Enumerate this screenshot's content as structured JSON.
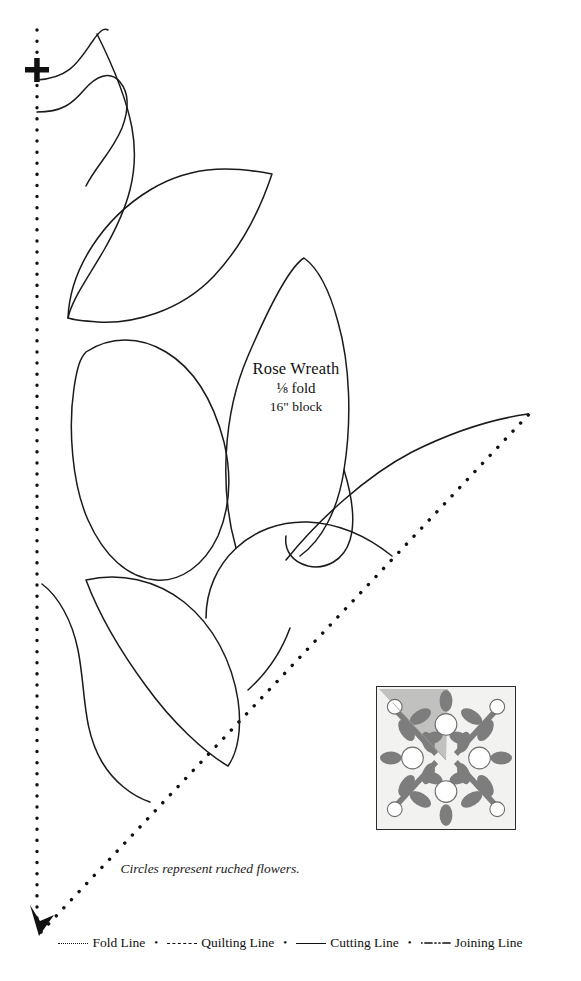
{
  "pattern": {
    "title": "Rose Wreath",
    "fold": "⅛ fold",
    "block_size": "16\" block",
    "caption": "Circles represent ruched flowers."
  },
  "legend": {
    "items": [
      {
        "style": "dotted",
        "label": "Fold Line"
      },
      {
        "style": "dashed",
        "label": "Quilting Line"
      },
      {
        "style": "solid",
        "label": "Cutting Line"
      },
      {
        "style": "dashdot",
        "label": "Joining Line"
      }
    ],
    "separator": "•"
  },
  "thumbnail": {
    "name": "rose-wreath-block-preview",
    "leaf_color": "#7d7d7d",
    "background_color": "#f2f2f0",
    "wedge_color": "#b9b9b7",
    "border_color": "#2b2b2b",
    "circle_fill": "#ffffff",
    "large_circle_count": 5,
    "corner_circle_count": 4
  },
  "marks": {
    "registration": "+",
    "fold_line_color": "#111111",
    "cutting_line_color": "#1a1a1a"
  }
}
